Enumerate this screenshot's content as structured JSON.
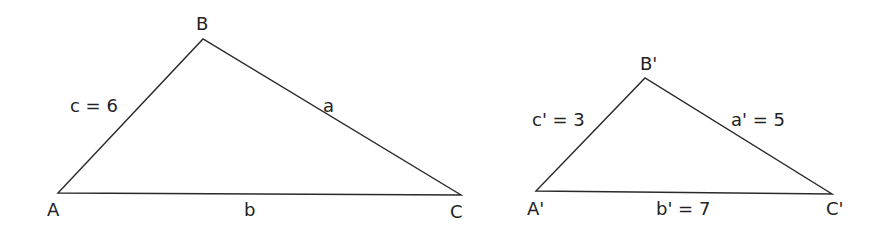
{
  "diagram": {
    "type": "similar-triangles",
    "colors": {
      "stroke": "#2a2a2a",
      "text": "#222222",
      "background": "#ffffff"
    },
    "triangle1": {
      "vertices": {
        "A": {
          "label": "A",
          "x": 58,
          "y": 193
        },
        "B": {
          "label": "B",
          "x": 203,
          "y": 39
        },
        "C": {
          "label": "C",
          "x": 461,
          "y": 195
        }
      },
      "sides": {
        "c": {
          "label": "c = 6",
          "value": 6
        },
        "a": {
          "label": "a",
          "value": null
        },
        "b": {
          "label": "b",
          "value": null
        }
      }
    },
    "triangle2": {
      "vertices": {
        "A": {
          "label": "A'",
          "x": 536,
          "y": 191
        },
        "B": {
          "label": "B'",
          "x": 645,
          "y": 78
        },
        "C": {
          "label": "C'",
          "x": 832,
          "y": 194
        }
      },
      "sides": {
        "c": {
          "label": "c' = 3",
          "value": 3
        },
        "a": {
          "label": "a' = 5",
          "value": 5
        },
        "b": {
          "label": "b' = 7",
          "value": 7
        }
      }
    }
  }
}
